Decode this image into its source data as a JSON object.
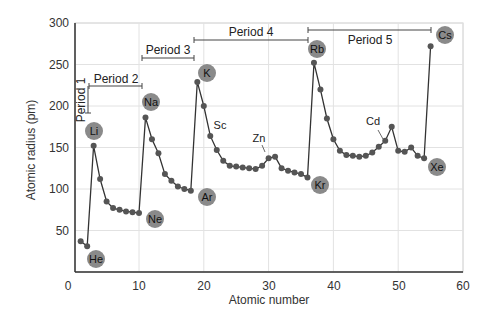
{
  "chart_data": {
    "type": "line",
    "title": "",
    "xlabel": "Atomic number",
    "ylabel": "Atomic radius (pm)",
    "xlim": [
      0,
      60
    ],
    "ylim": [
      0,
      300
    ],
    "xticks": [
      0,
      10,
      20,
      30,
      40,
      50,
      60
    ],
    "yticks": [
      50,
      100,
      150,
      200,
      250,
      300
    ],
    "grid": true,
    "series": [
      {
        "name": "Atomic radius",
        "x": [
          1,
          2,
          3,
          4,
          5,
          6,
          7,
          8,
          9,
          10,
          11,
          12,
          13,
          14,
          15,
          16,
          17,
          18,
          19,
          20,
          21,
          22,
          23,
          24,
          25,
          26,
          27,
          28,
          29,
          30,
          31,
          32,
          33,
          34,
          35,
          36,
          37,
          38,
          39,
          40,
          41,
          42,
          43,
          44,
          45,
          46,
          47,
          48,
          49,
          50,
          51,
          52,
          53,
          54,
          55
        ],
        "values": [
          37,
          31,
          152,
          112,
          85,
          77,
          75,
          73,
          72,
          71,
          186,
          160,
          143,
          118,
          110,
          103,
          100,
          98,
          229,
          200,
          164,
          147,
          134,
          128,
          127,
          126,
          125,
          124,
          128,
          137,
          139,
          125,
          122,
          120,
          118,
          114,
          252,
          220,
          185,
          160,
          146,
          141,
          140,
          139,
          140,
          144,
          151,
          158,
          175,
          146,
          145,
          150,
          140,
          137,
          272
        ]
      }
    ],
    "labeled_elements": [
      {
        "symbol": "He",
        "x": 2
      },
      {
        "symbol": "Li",
        "x": 3
      },
      {
        "symbol": "Ne",
        "x": 10
      },
      {
        "symbol": "Na",
        "x": 11
      },
      {
        "symbol": "Ar",
        "x": 18
      },
      {
        "symbol": "K",
        "x": 19
      },
      {
        "symbol": "Kr",
        "x": 36
      },
      {
        "symbol": "Rb",
        "x": 37
      },
      {
        "symbol": "Xe",
        "x": 54
      },
      {
        "symbol": "Cs",
        "x": 55
      }
    ],
    "annotations": [
      {
        "text": "Sc",
        "x": 21
      },
      {
        "text": "Zn",
        "x": 30
      },
      {
        "text": "Cd",
        "x": 48
      }
    ],
    "periods": [
      {
        "label": "Period 1",
        "from": 1,
        "to": 2
      },
      {
        "label": "Period 2",
        "from": 2,
        "to": 10
      },
      {
        "label": "Period 3",
        "from": 10,
        "to": 18
      },
      {
        "label": "Period 4",
        "from": 18,
        "to": 36
      },
      {
        "label": "Period 5",
        "from": 36,
        "to": 54
      }
    ]
  },
  "labels": {
    "x_axis": "Atomic number",
    "y_axis": "Atomic radius (pm)",
    "x_ticks": [
      "0",
      "10",
      "20",
      "30",
      "40",
      "50",
      "60"
    ],
    "y_ticks": [
      "50",
      "100",
      "150",
      "200",
      "250",
      "300"
    ],
    "period_1": "Period 1",
    "period_2": "Period 2",
    "period_3": "Period 3",
    "period_4": "Period 4",
    "period_5": "Period 5",
    "el_he": "He",
    "el_li": "Li",
    "el_ne": "Ne",
    "el_na": "Na",
    "el_ar": "Ar",
    "el_k": "K",
    "el_kr": "Kr",
    "el_rb": "Rb",
    "el_xe": "Xe",
    "el_cs": "Cs",
    "ann_sc": "Sc",
    "ann_zn": "Zn",
    "ann_cd": "Cd"
  },
  "colors": {
    "line": "#333333",
    "marker": "#555555",
    "badge": "#8a8a8a",
    "grid": "#e2e2e2",
    "axis": "#333333"
  }
}
